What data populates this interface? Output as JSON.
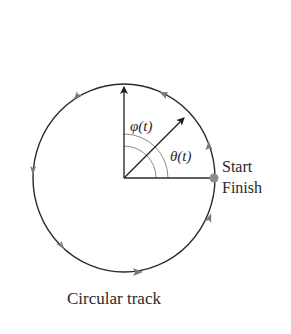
{
  "diagram": {
    "caption": "Circular track",
    "labels": {
      "phi": "φ(t)",
      "theta": "θ(t)",
      "start": "Start",
      "finish": "Finish"
    },
    "geometry": {
      "center": [
        124,
        178
      ],
      "radius_x": 91,
      "radius_y": 94,
      "theta_direction_deg": 45,
      "phi_direction_deg": 90,
      "start_point": [
        214,
        178
      ]
    },
    "direction": "counterclockwise",
    "colors": {
      "stroke": "#2b2b2b",
      "arc_marks": "#8a8a8a",
      "start_dot": "#8c8c8c",
      "text": "#2a2a2a"
    }
  }
}
